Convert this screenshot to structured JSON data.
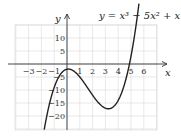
{
  "chart_data": {
    "type": "line",
    "title": "y = x³ − 5x² + x − 2",
    "xlabel": "x",
    "ylabel": "y",
    "xlim": [
      -4,
      7
    ],
    "ylim": [
      -25,
      15
    ],
    "grid": true,
    "x_ticks": [
      -3,
      -2,
      -1,
      1,
      2,
      3,
      4,
      5,
      6
    ],
    "x_tick_labels": [
      "−3",
      "−2",
      "−1",
      "1",
      "2",
      "3",
      "4",
      "5",
      "6"
    ],
    "y_ticks": [
      10,
      5,
      -5,
      -10,
      -15,
      -20
    ],
    "y_tick_labels": [
      "10",
      "5",
      "−5",
      "−10",
      "−15",
      "−20"
    ],
    "series": [
      {
        "name": "y = x³ − 5x² + x − 2",
        "function": "x^3 - 5x^2 + x - 2",
        "x": [
          -1.9,
          -1.5,
          -1,
          -0.5,
          0,
          0.1,
          0.5,
          1,
          1.5,
          2,
          2.5,
          3,
          3.2,
          3.5,
          4,
          4.5,
          5,
          5.2,
          5.5
        ],
        "y": [
          -28.9,
          -18.1,
          -9,
          -4.9,
          -2,
          -1.95,
          -2.63,
          -5,
          -8.38,
          -12,
          -14.88,
          -17,
          -17.15,
          -16.38,
          -14,
          -9.13,
          3,
          7.55,
          16.13
        ]
      }
    ],
    "key_points": {
      "local_max": [
        0.1,
        -1.95
      ],
      "local_min": [
        3.23,
        -17.15
      ],
      "x_intercept": 4.9,
      "y_intercept": -2
    },
    "colors": {
      "curve": "#222222",
      "grid": "#d8d8d8",
      "axes": "#333333"
    }
  }
}
